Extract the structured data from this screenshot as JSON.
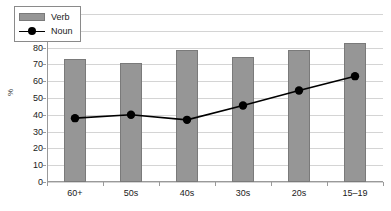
{
  "chart_data": {
    "type": "bar",
    "title": "",
    "xlabel": "",
    "ylabel": "%",
    "ylim": [
      0,
      100
    ],
    "ytick_step": 10,
    "yticks": [
      100,
      90,
      80,
      70,
      60,
      50,
      40,
      30,
      20,
      10,
      0
    ],
    "grid": true,
    "legend_position": "top-left-inside",
    "categories": [
      "60+",
      "50s",
      "40s",
      "30s",
      "20s",
      "15–19"
    ],
    "series": [
      {
        "name": "Verb",
        "type": "bar",
        "color": "#969696",
        "values": [
          73,
          71,
          78.5,
          74.5,
          78.5,
          83
        ]
      },
      {
        "name": "Noun",
        "type": "line",
        "color": "#000000",
        "marker": "filled-circle",
        "values": [
          38,
          40,
          37,
          45.5,
          54.5,
          63
        ]
      }
    ]
  },
  "legend": {
    "items": [
      {
        "label": "Verb",
        "swatch": "bar-swatch"
      },
      {
        "label": "Noun",
        "swatch": "line-marker-swatch"
      }
    ]
  },
  "axis": {
    "y_title": "%"
  }
}
